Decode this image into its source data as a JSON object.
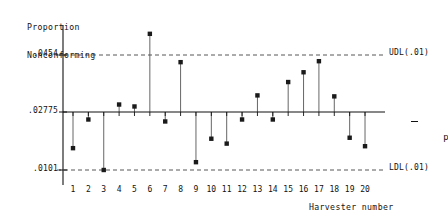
{
  "chart_data": {
    "type": "scatter",
    "title": "",
    "subtitle": "",
    "xlabel": "Harvester number",
    "ylabel": "Proportion Nonconforming",
    "ylabel_lines": [
      "Proportion",
      "Nonconforming"
    ],
    "grid": false,
    "legend_position": "none",
    "categories": [
      1,
      2,
      3,
      4,
      5,
      6,
      7,
      8,
      9,
      10,
      11,
      12,
      13,
      14,
      15,
      16,
      17,
      18,
      19,
      20
    ],
    "x_tick_labels": [
      "1",
      "2",
      "3",
      "4",
      "5",
      "6",
      "7",
      "8",
      "9",
      "10",
      "11",
      "12",
      "13",
      "14",
      "15",
      "16",
      "17",
      "18",
      "19",
      "20"
    ],
    "values": [
      0.0168,
      0.0256,
      0.0101,
      0.0302,
      0.0296,
      0.0519,
      0.025,
      0.0432,
      0.0125,
      0.0197,
      0.0182,
      0.0256,
      0.033,
      0.0256,
      0.0371,
      0.0401,
      0.0435,
      0.0327,
      0.02,
      0.0174
    ],
    "y_tick_labels": [
      ".0454",
      ".02775",
      ".0101"
    ],
    "y_tick_values": [
      0.0454,
      0.02775,
      0.0101
    ],
    "ylim": [
      0.0065,
      0.0565
    ],
    "xlim": [
      0.4,
      20.6
    ],
    "center_line": {
      "value": 0.02775,
      "label": "p̄",
      "label_text": "p",
      "style": "solid"
    },
    "control_limits": [
      {
        "name": "UDL",
        "label": "UDL(.01)",
        "value": 0.0454,
        "style": "dashed"
      },
      {
        "name": "LDL",
        "label": "LDL(.01)",
        "value": 0.0101,
        "style": "dashed"
      }
    ],
    "marker": "filled-square",
    "stem_chart": true,
    "colors": {
      "axis": "#111111",
      "marker": "#1a1a1a",
      "stem": "#555555",
      "limit_line": "#444444",
      "center_line": "#111111",
      "background": "#ffffff"
    }
  }
}
